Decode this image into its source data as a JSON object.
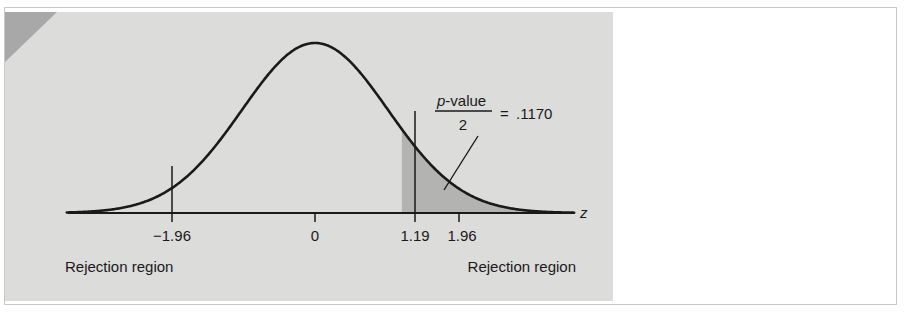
{
  "figure": {
    "background_color": "#ffffff",
    "plate_color": "#dcdcdb",
    "frame_color": "#c9c9c9",
    "corner_wedge_color": "#a8a8a8",
    "curve_color": "#1a1a1a",
    "shade_fill_color": "#b0b0b0",
    "axis_label": "z"
  },
  "annotation": {
    "numerator": "p-value",
    "denominator": "2",
    "equals": "=",
    "value": ".1170",
    "full_text": "p-value/2 = .1170"
  },
  "labels": {
    "rejection_region_left": "Rejection region",
    "rejection_region_right": "Rejection region"
  },
  "chart_data": {
    "type": "line",
    "title": "",
    "subtitle": "",
    "xlabel": "z",
    "ylabel": "",
    "grid": false,
    "legend": "none",
    "distribution": "standard normal",
    "xlim": [
      -3.4,
      3.55
    ],
    "ylim": [
      0,
      0.435
    ],
    "x_tick_values": [
      -1.96,
      0,
      1.19,
      1.96
    ],
    "x_tick_labels": [
      "−1.96",
      "0",
      "1.19",
      "1.96"
    ],
    "annotations": [
      {
        "text": "p-value/2 = .1170",
        "kind": "tail-area-callout",
        "points_to_x": 1.45,
        "value": 0.117
      }
    ],
    "shaded_regions": [
      {
        "name": "p-value-upper-tail",
        "from_x": 1.19,
        "to_x": 3.55,
        "area": 0.117,
        "fill": "#b0b0b0"
      }
    ],
    "vertical_markers": [
      {
        "x": -1.96,
        "to_curve": true,
        "label": "−1.96"
      },
      {
        "x": 0,
        "to_curve": false,
        "label": "0"
      },
      {
        "x": 1.19,
        "to_curve": true,
        "label": "1.19"
      },
      {
        "x": 1.96,
        "to_curve": false,
        "label": "1.96"
      }
    ],
    "region_labels": [
      {
        "text": "Rejection region",
        "side": "left",
        "at_x": -2.6
      },
      {
        "text": "Rejection region",
        "side": "right",
        "at_x": 2.2
      }
    ],
    "series": [
      {
        "name": "standard normal density",
        "x": [
          -3.4,
          -3.2,
          -3.0,
          -2.8,
          -2.6,
          -2.4,
          -2.2,
          -2.0,
          -1.8,
          -1.6,
          -1.4,
          -1.2,
          -1.0,
          -0.8,
          -0.6,
          -0.4,
          -0.2,
          0.0,
          0.2,
          0.4,
          0.6,
          0.8,
          1.0,
          1.2,
          1.4,
          1.6,
          1.8,
          2.0,
          2.2,
          2.4,
          2.6,
          2.8,
          3.0,
          3.2,
          3.4
        ],
        "y": [
          0.0012,
          0.0024,
          0.0044,
          0.0079,
          0.0136,
          0.0224,
          0.0355,
          0.054,
          0.079,
          0.1109,
          0.1497,
          0.1942,
          0.242,
          0.2897,
          0.3332,
          0.3683,
          0.391,
          0.3989,
          0.391,
          0.3683,
          0.3332,
          0.2897,
          0.242,
          0.1942,
          0.1497,
          0.1109,
          0.079,
          0.054,
          0.0355,
          0.0224,
          0.0136,
          0.0079,
          0.0044,
          0.0024,
          0.0012
        ]
      }
    ]
  }
}
